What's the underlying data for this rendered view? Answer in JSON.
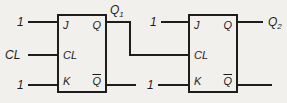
{
  "diagram_title": "two-stage JK flip-flop ripple counter",
  "colors": {
    "background": "#f2f0ec",
    "line": "#1d1d1d"
  },
  "ff1": {
    "pins": {
      "j": "J",
      "cl": "CL",
      "k": "K",
      "q": "Q",
      "qbar": "Q",
      "qbar_has_overline": true
    }
  },
  "ff2": {
    "pins": {
      "j": "J",
      "cl": "CL",
      "k": "K",
      "q": "Q",
      "qbar": "Q",
      "qbar_has_overline": true
    }
  },
  "inputs": {
    "ff1_j": "1",
    "ff1_cl": "CL",
    "ff1_k": "1",
    "ff2_j": "1",
    "ff2_k": "1"
  },
  "outputs": {
    "q1_base": "Q",
    "q1_sub": "1",
    "q2_base": "Q",
    "q2_sub": "2"
  }
}
